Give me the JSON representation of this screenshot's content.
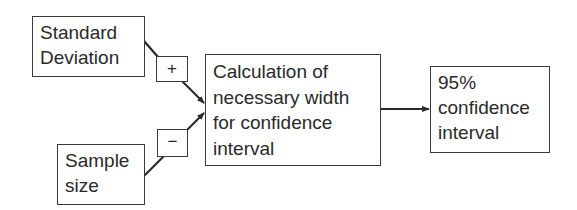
{
  "diagram": {
    "nodes": {
      "standard_deviation": {
        "lines": [
          "Standard",
          "Deviation"
        ]
      },
      "sample_size": {
        "lines": [
          "Sample",
          "size"
        ]
      },
      "calculation": {
        "lines": [
          "Calculation of",
          "necessary width",
          "for confidence",
          "interval"
        ]
      },
      "result": {
        "lines": [
          "95%",
          "confidence",
          "interval"
        ]
      }
    },
    "edge_labels": {
      "sd_to_calc": "+",
      "size_to_calc": "−"
    },
    "edges": [
      {
        "from": "standard_deviation",
        "to": "calculation",
        "sign": "+"
      },
      {
        "from": "sample_size",
        "to": "calculation",
        "sign": "−"
      },
      {
        "from": "calculation",
        "to": "result",
        "sign": ""
      }
    ],
    "colors": {
      "stroke": "#3a3a3a",
      "text": "#2a2a2a",
      "background": "#ffffff"
    }
  }
}
